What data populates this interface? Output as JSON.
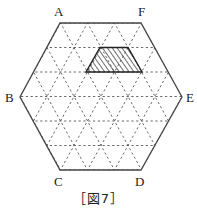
{
  "figure": {
    "caption": "［図7］",
    "vertices": [
      {
        "label": "A",
        "x": 60,
        "y": 23,
        "lx": 54,
        "ly": 16
      },
      {
        "label": "F",
        "x": 141,
        "y": 23,
        "lx": 138,
        "ly": 16
      },
      {
        "label": "E",
        "x": 182,
        "y": 97,
        "lx": 186,
        "ly": 102
      },
      {
        "label": "D",
        "x": 141,
        "y": 170,
        "lx": 135,
        "ly": 186
      },
      {
        "label": "C",
        "x": 60,
        "y": 170,
        "lx": 54,
        "ly": 186
      },
      {
        "label": "B",
        "x": 20,
        "y": 97,
        "lx": 5,
        "ly": 102
      }
    ],
    "grid": {
      "divisions_per_side": 3,
      "center": {
        "x": 101,
        "y": 96.5
      },
      "unit_x": 27,
      "row_height": 24.5,
      "line_style": "dashed",
      "line_color": "#555555"
    },
    "shaded_trapezoid": {
      "points": [
        [
          100,
          47.5
        ],
        [
          128,
          47.5
        ],
        [
          142,
          72
        ],
        [
          86,
          72
        ]
      ],
      "hatch": "diagonal",
      "stroke": "#222222"
    },
    "hexagon_stroke": "#444444"
  }
}
